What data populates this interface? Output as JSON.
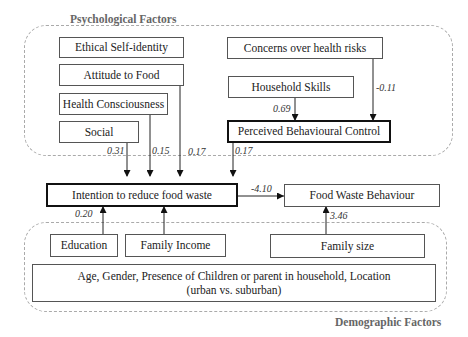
{
  "groups": {
    "psychological": {
      "label": "Psychological Factors"
    },
    "demographic": {
      "label": "Demographic Factors"
    }
  },
  "nodes": {
    "ethical_self_identity": "Ethical Self-identity",
    "attitude_to_food": "Attitude to Food",
    "health_consciousness": "Health Consciousness",
    "social": "Social",
    "concerns_health_risks": "Concerns over health risks",
    "household_skills": "Household Skills",
    "perceived_behavioural_control": "Perceived Behavioural Control",
    "intention": "Intention to reduce food waste",
    "food_waste_behaviour": "Food Waste Behaviour",
    "education": "Education",
    "family_income": "Family Income",
    "family_size": "Family size",
    "other_demographics": "Age, Gender, Presence of Children or parent in household, Location (urban vs. suburban)"
  },
  "edges": [
    {
      "from": "social",
      "to": "intention",
      "coef": "0.31"
    },
    {
      "from": "health_consciousness",
      "to": "intention",
      "coef": "0.15"
    },
    {
      "from": "attitude_to_food",
      "to": "intention",
      "coef": "0.17"
    },
    {
      "from": "perceived_behavioural_control",
      "to": "intention",
      "coef": "0.17"
    },
    {
      "from": "household_skills",
      "to": "perceived_behavioural_control",
      "coef": "0.69"
    },
    {
      "from": "concerns_health_risks",
      "to": "perceived_behavioural_control",
      "coef": "-0.11"
    },
    {
      "from": "intention",
      "to": "food_waste_behaviour",
      "coef": "-4.10"
    },
    {
      "from": "education",
      "to": "intention",
      "coef": "0.20"
    },
    {
      "from": "family_income",
      "to": "intention",
      "coef": ""
    },
    {
      "from": "family_size",
      "to": "food_waste_behaviour",
      "coef": "3.46"
    }
  ],
  "coefs": {
    "social": "0.31",
    "health": "0.15",
    "attitude": "0.17",
    "pbc": "0.17",
    "skills": "0.69",
    "concerns": "-0.11",
    "intention_fwb": "-4.10",
    "education": "0.20",
    "family_size": "3.46"
  },
  "colors": {
    "line": "#222222",
    "dashed": "#aaaaaa",
    "label_gray": "#666666"
  }
}
